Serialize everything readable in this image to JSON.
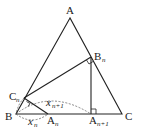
{
  "diagram": {
    "type": "geometry",
    "points": {
      "A": {
        "label": "A",
        "x": 70,
        "y": 18
      },
      "B": {
        "label": "B",
        "x": 16,
        "y": 114
      },
      "C": {
        "label": "C",
        "x": 122,
        "y": 114
      },
      "Bn": {
        "label": "B",
        "sub": "n",
        "x": 91,
        "y": 57
      },
      "An1": {
        "label": "A",
        "sub": "n+1",
        "x": 91,
        "y": 114
      },
      "Cn": {
        "label": "C",
        "sub": "n",
        "x": 24,
        "y": 98
      },
      "An": {
        "label": "A",
        "sub": "n",
        "x": 48,
        "y": 114
      }
    },
    "lengths": {
      "xn": {
        "label": "x",
        "sub": "n"
      },
      "xn1": {
        "label": "x",
        "sub": "n+1"
      }
    },
    "stroke_color": "#222222",
    "dashed_color": "#555555"
  }
}
